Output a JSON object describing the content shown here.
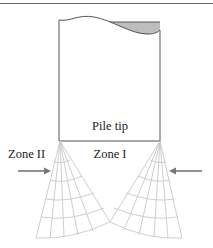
{
  "diagram": {
    "labels": {
      "pile_tip": "Pile tip",
      "zone_1": "Zone I",
      "zone_2": "Zone II"
    },
    "arrows": [
      {
        "side": "left",
        "direction": "right"
      },
      {
        "side": "right",
        "direction": "left"
      }
    ],
    "colors": {
      "outline": "#555555",
      "fill_shaded": "#bdbdbd",
      "fan_lines": "#c8c8c8",
      "arrow": "#777777",
      "text": "#222222"
    }
  }
}
